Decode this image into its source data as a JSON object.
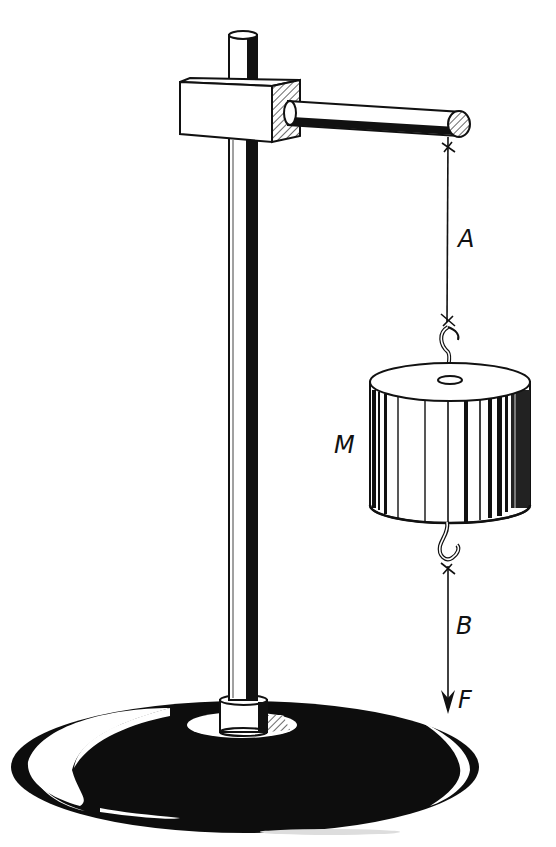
{
  "diagram": {
    "labels": {
      "upper_string": "A",
      "mass": "M",
      "lower_string": "B",
      "force": "F"
    },
    "components": [
      "stand-base",
      "vertical-rod",
      "clamp-block",
      "horizontal-arm",
      "string-A",
      "hanging-mass-M",
      "string-B",
      "force-arrow-F"
    ],
    "colors": {
      "ink": "#111111",
      "paper": "#ffffff",
      "hatch": "#555555"
    }
  }
}
